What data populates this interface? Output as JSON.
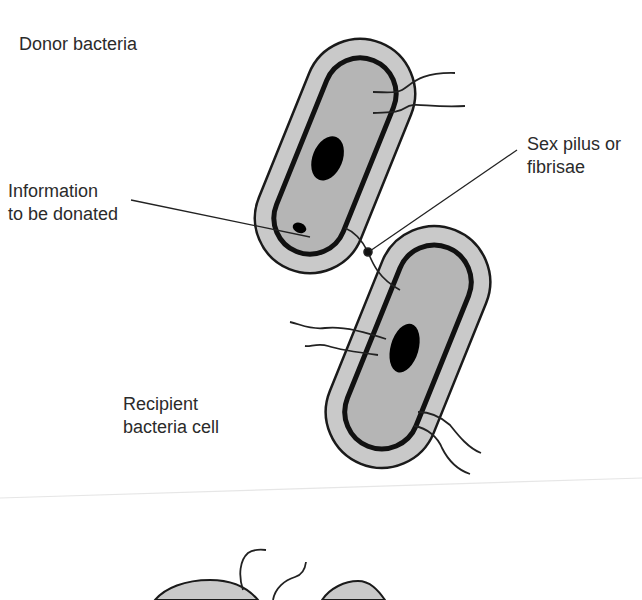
{
  "diagram": {
    "type": "biology-illustration",
    "colors": {
      "background": "#ffffff",
      "cytoplasm_outer": "#c8c8c8",
      "cytoplasm_inner": "#b4b4b4",
      "outline": "#1a1a1a",
      "nucleoid": "#000000",
      "text": "#2b2b2b"
    },
    "labels": {
      "donor": {
        "line1": "Donor bacteria"
      },
      "information": {
        "line1": "Information",
        "line2": "to be donated"
      },
      "pilus": {
        "line1": "Sex pilus or",
        "line2": "fibrisae"
      },
      "recipient": {
        "line1": "Recipient",
        "line2": "bacteria cell"
      }
    },
    "cells": [
      {
        "id": "donor-cell",
        "role": "donor",
        "has_nucleoid": true,
        "has_plasmid": true,
        "flagella": 2
      },
      {
        "id": "recipient-cell",
        "role": "recipient",
        "has_nucleoid": true,
        "flagella": 4
      },
      {
        "id": "bottom-cell-left",
        "role": "partial",
        "flagella": 2
      },
      {
        "id": "bottom-cell-right",
        "role": "partial",
        "flagella": 0
      }
    ]
  }
}
